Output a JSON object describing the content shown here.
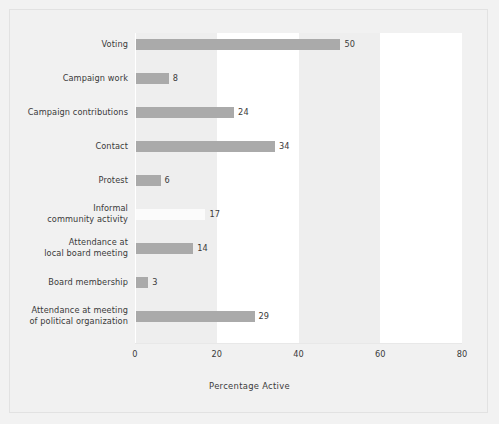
{
  "chart_data": {
    "type": "bar",
    "orientation": "horizontal",
    "title": "",
    "xlabel": "Percentage Active",
    "ylabel": "",
    "xlim": [
      0,
      80
    ],
    "xticks": [
      0,
      20,
      40,
      60,
      80
    ],
    "xtick_labels": [
      "0",
      "20",
      "40",
      "60",
      "80"
    ],
    "grid": false,
    "legend": null,
    "bar_color": "#aaaaaa",
    "faint_bar_color": "#fbfbfb",
    "background_color": "#f1f1f1",
    "band_color": "#ffffff",
    "categories": [
      "Voting",
      "Campaign work",
      "Campaign contributions",
      "Contact",
      "Protest",
      "Informal\ncommunity activity",
      "Attendance at\nlocal board meeting",
      "Board membership",
      "Attendance at meeting\nof political organization"
    ],
    "values": [
      50,
      8,
      24,
      34,
      6,
      17,
      14,
      3,
      29
    ],
    "value_labels": [
      "50",
      "8",
      "24",
      "34",
      "6",
      "17",
      "14",
      "3",
      "29"
    ],
    "bars": [
      {
        "category": "Voting",
        "value": 50,
        "label": "50",
        "faint": false
      },
      {
        "category": "Campaign work",
        "value": 8,
        "label": "8",
        "faint": false
      },
      {
        "category": "Campaign contributions",
        "value": 24,
        "label": "24",
        "faint": false
      },
      {
        "category": "Contact",
        "value": 34,
        "label": "34",
        "faint": false
      },
      {
        "category": "Protest",
        "value": 6,
        "label": "6",
        "faint": false
      },
      {
        "category": "Informal\ncommunity activity",
        "value": 17,
        "label": "17",
        "faint": true
      },
      {
        "category": "Attendance at\nlocal board meeting",
        "value": 14,
        "label": "14",
        "faint": false
      },
      {
        "category": "Board membership",
        "value": 3,
        "label": "3",
        "faint": false
      },
      {
        "category": "Attendance at meeting\nof political organization",
        "value": 29,
        "label": "29",
        "faint": false
      }
    ],
    "shaded_bands": [
      [
        20,
        40
      ],
      [
        60,
        80
      ]
    ]
  }
}
